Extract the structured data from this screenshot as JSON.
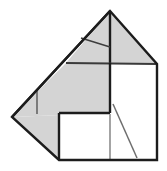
{
  "canvas": {
    "width": 167,
    "height": 171,
    "background": "#ffffff",
    "title": "Geometric polyhedron net figure"
  },
  "style": {
    "shaded_fill": "#d4d4d4",
    "unshaded_fill": "#ffffff",
    "outline_color": "#1c1c1c",
    "outline_width": 2.4,
    "interior_line_color": "#4a4a4a",
    "interior_line_width": 1.4,
    "light_line_color": "#9a9a9a",
    "light_line_width": 1.6
  },
  "vertices": {
    "apex": {
      "x": 110,
      "y": 11
    },
    "right": {
      "x": 157,
      "y": 64
    },
    "left": {
      "x": 12,
      "y": 117
    },
    "mid_left_top": {
      "x": 66,
      "y": 63
    },
    "square_top_left": {
      "x": 110,
      "y": 63
    },
    "square_top_right": {
      "x": 157,
      "y": 64
    },
    "square_bottom_right": {
      "x": 157,
      "y": 160
    },
    "square_bottom_left": {
      "x": 59,
      "y": 160
    },
    "inner_left": {
      "x": 59,
      "y": 113
    },
    "inner_right": {
      "x": 110,
      "y": 113
    }
  },
  "faces": [
    {
      "name": "upper-left-shaded-triangle",
      "fill": "#d4d4d4",
      "points": "110,11 110,63 66,63"
    },
    {
      "name": "upper-right-shaded-triangle",
      "fill": "#d4d4d4",
      "points": "110,11 157,64 110,63"
    },
    {
      "name": "left-shaded-quad",
      "fill": "#d4d4d4",
      "points": "66,63 110,63 110,113 12,117"
    },
    {
      "name": "lower-left-shaded-triangle",
      "fill": "#d4d4d4",
      "points": "12,117 110,113 59,160"
    },
    {
      "name": "right-white-square",
      "fill": "#ffffff",
      "points": "110,63 157,64 157,160 59,160 59,113 110,113"
    }
  ],
  "outline_path": "M110,11 L157,64 L157,160 L59,160 L12,117 Z",
  "interior_edges": [
    {
      "name": "apex-vertical-edge",
      "x1": 110,
      "y1": 11,
      "x2": 110,
      "y2": 63,
      "color": "#1c1c1c",
      "width": 2.4
    },
    {
      "name": "ridge-diagonal-left",
      "x1": 110,
      "y1": 11,
      "x2": 12,
      "y2": 117,
      "color": "#1c1c1c",
      "width": 2.4
    },
    {
      "name": "horizontal-fold",
      "x1": 66,
      "y1": 63,
      "x2": 157,
      "y2": 64,
      "color": "#3a3a3a",
      "width": 1.8
    },
    {
      "name": "square-left-edge",
      "x1": 110,
      "y1": 63,
      "x2": 110,
      "y2": 113,
      "color": "#1c1c1c",
      "width": 2.4
    },
    {
      "name": "square-inner-bottom",
      "x1": 59,
      "y1": 113,
      "x2": 110,
      "y2": 113,
      "color": "#1c1c1c",
      "width": 2.4
    },
    {
      "name": "square-inner-left",
      "x1": 59,
      "y1": 113,
      "x2": 59,
      "y2": 160,
      "color": "#1c1c1c",
      "width": 2.4
    },
    {
      "name": "short-fold-diagonal",
      "x1": 81,
      "y1": 38,
      "x2": 110,
      "y2": 47,
      "color": "#3d3d3d",
      "width": 1.5
    },
    {
      "name": "left-crease-vertical",
      "x1": 37,
      "y1": 90,
      "x2": 37,
      "y2": 114,
      "color": "#555555",
      "width": 1.4
    },
    {
      "name": "lower-crease-vertical",
      "x1": 110,
      "y1": 114,
      "x2": 110,
      "y2": 159,
      "color": "#9a9a9a",
      "width": 1.8
    },
    {
      "name": "lower-crease-diagonal",
      "x1": 113,
      "y1": 104,
      "x2": 137,
      "y2": 158,
      "color": "#6e6e6e",
      "width": 1.5
    }
  ]
}
